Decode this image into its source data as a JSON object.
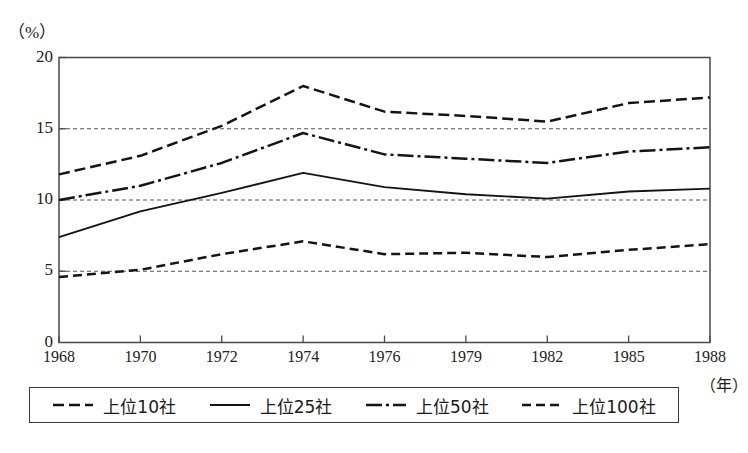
{
  "labels": {
    "unit_y": "（%）",
    "unit_x": "（年）"
  },
  "axis": {
    "y_ticks": [
      "0",
      "5",
      "10",
      "15",
      "20"
    ],
    "x_ticks": [
      "1968",
      "1970",
      "1972",
      "1974",
      "1976",
      "1979",
      "1982",
      "1985",
      "1988"
    ]
  },
  "legend": {
    "items": [
      {
        "label": "上位10社",
        "style": "dashed",
        "icon": "dashed-line-icon"
      },
      {
        "label": "上位25社",
        "style": "solid",
        "icon": "solid-line-icon"
      },
      {
        "label": "上位50社",
        "style": "dashdot",
        "icon": "dash-dot-line-icon"
      },
      {
        "label": "上位100社",
        "style": "finedash",
        "icon": "fine-dashed-line-icon"
      }
    ]
  },
  "chart_data": {
    "type": "line",
    "title": "",
    "xlabel": "（年）",
    "ylabel": "（%）",
    "x": [
      "1968",
      "1970",
      "1972",
      "1974",
      "1976",
      "1979",
      "1982",
      "1985",
      "1988"
    ],
    "categories": [
      "1968",
      "1970",
      "1972",
      "1974",
      "1976",
      "1979",
      "1982",
      "1985",
      "1988"
    ],
    "ylim": [
      0,
      20
    ],
    "yticks": [
      0,
      5,
      10,
      15,
      20
    ],
    "grid": "horizontal dotted gridlines at 5, 10, 15",
    "legend_position": "below plot, boxed",
    "series": [
      {
        "name": "上位100社",
        "style": "dashed",
        "values": [
          11.8,
          13.1,
          15.2,
          18.0,
          16.2,
          15.9,
          15.5,
          16.8,
          17.2
        ]
      },
      {
        "name": "上位50社",
        "style": "dashdot",
        "values": [
          10.0,
          11.0,
          12.6,
          14.7,
          13.2,
          12.9,
          12.6,
          13.4,
          13.7
        ]
      },
      {
        "name": "上位25社",
        "style": "solid",
        "values": [
          7.4,
          9.2,
          10.5,
          11.9,
          10.9,
          10.4,
          10.1,
          10.6,
          10.8
        ]
      },
      {
        "name": "上位10社",
        "style": "finedash",
        "values": [
          4.6,
          5.1,
          6.2,
          7.1,
          6.2,
          6.3,
          6.0,
          6.5,
          6.9
        ]
      }
    ]
  }
}
